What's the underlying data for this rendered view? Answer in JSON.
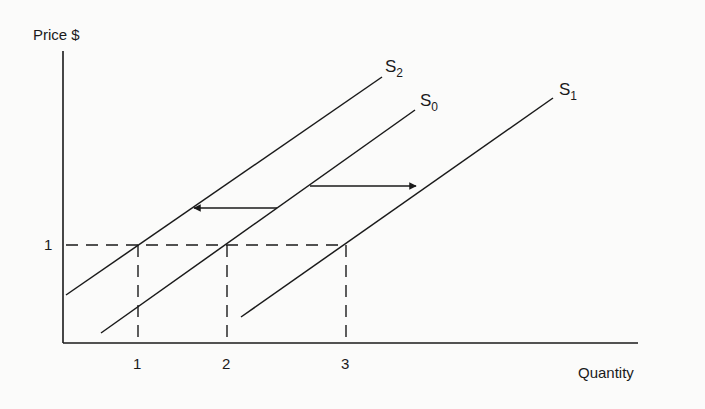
{
  "diagram": {
    "type": "supply-shift",
    "y_axis": {
      "label": "Price $",
      "ticks": [
        {
          "label": "1",
          "value": 1
        }
      ]
    },
    "x_axis": {
      "label": "Quantity",
      "ticks": [
        {
          "label": "1"
        },
        {
          "label": "2"
        },
        {
          "label": "3"
        }
      ]
    },
    "curves": [
      {
        "id": "S2",
        "base": "S",
        "sub": "2"
      },
      {
        "id": "S0",
        "base": "S",
        "sub": "0"
      },
      {
        "id": "S1",
        "base": "S",
        "sub": "1"
      }
    ],
    "arrows": [
      {
        "direction": "right",
        "from": "S0",
        "to": "S1"
      },
      {
        "direction": "left",
        "from": "S0",
        "to": "S2"
      }
    ],
    "reference_price": 1,
    "quantities_at_price_1": {
      "S2": 1,
      "S0": 2,
      "S1": 3
    }
  },
  "colors": {
    "ink": "#1a1a1a",
    "background": "#fbfbfa"
  }
}
